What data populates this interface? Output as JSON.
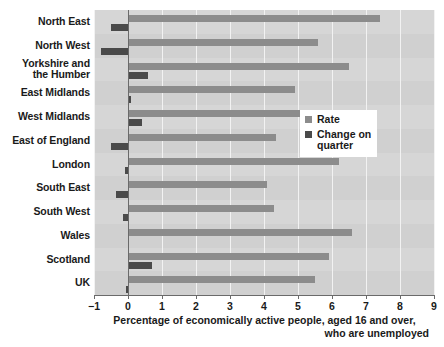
{
  "chart_data": {
    "type": "bar",
    "orientation": "horizontal",
    "title": "",
    "xlabel_line1": "Percentage of economically active people, aged 16 and over,",
    "xlabel_line2": "who are unemployed",
    "ylabel": "",
    "categories": [
      "North East",
      "North West",
      "Yorkshire and\nthe Humber",
      "East Midlands",
      "West Midlands",
      "East of England",
      "London",
      "South East",
      "South West",
      "Wales",
      "Scotland",
      "UK"
    ],
    "series": [
      {
        "name": "Rate",
        "color": "#8c8c8c",
        "values": [
          7.4,
          5.6,
          6.5,
          4.9,
          6.3,
          4.35,
          6.2,
          4.1,
          4.3,
          6.6,
          5.9,
          5.5
        ]
      },
      {
        "name": "Change on quarter",
        "color": "#4a4a4a",
        "values": [
          -0.5,
          -0.8,
          0.6,
          0.1,
          0.4,
          -0.5,
          -0.1,
          -0.35,
          -0.15,
          0.0,
          0.7,
          -0.05
        ]
      }
    ],
    "xlim": [
      -1,
      9
    ],
    "xticks": [
      -1,
      0,
      1,
      2,
      3,
      4,
      5,
      6,
      7,
      8,
      9
    ],
    "xtick_labels": [
      "−1",
      "0",
      "1",
      "2",
      "3",
      "4",
      "5",
      "6",
      "7",
      "8",
      "9"
    ],
    "grid": true,
    "grid_axis": "x",
    "legend_position": "right-middle",
    "plot_background": "#d6d6d6",
    "gridline_color": "#f2f2f2",
    "axis_color": "#6a6a6a"
  },
  "legend": {
    "items": [
      {
        "label": "Rate",
        "color": "#8c8c8c"
      },
      {
        "label": "Change on\nquarter",
        "color": "#4a4a4a"
      }
    ]
  },
  "axis": {
    "title_line1": "Percentage of economically active people, aged 16 and over,",
    "title_line2": "who are unemployed"
  },
  "clipped_title": ""
}
